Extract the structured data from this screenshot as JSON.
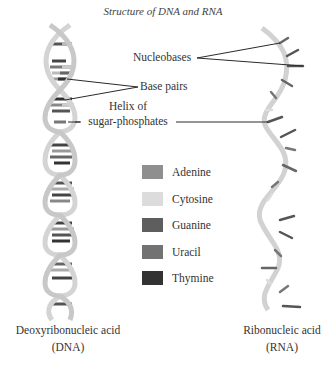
{
  "title": "Structure of DNA and RNA",
  "labels": {
    "nucleobases": "Nucleobases",
    "base_pairs": "Base pairs",
    "helix_line1": "Helix of",
    "helix_line2": "sugar-phosphates"
  },
  "legend": [
    {
      "label": "Adenine",
      "color": "#8f8f8f"
    },
    {
      "label": "Cytosine",
      "color": "#dcdcdc"
    },
    {
      "label": "Guanine",
      "color": "#5e5e5e"
    },
    {
      "label": "Uracil",
      "color": "#727272"
    },
    {
      "label": "Thymine",
      "color": "#333333"
    }
  ],
  "molecules": {
    "dna": {
      "name_line1": "Deoxyribonucleic acid",
      "name_line2": "(DNA)"
    },
    "rna": {
      "name_line1": "Ribonucleic acid",
      "name_line2": "(RNA)"
    }
  },
  "colors": {
    "backbone": "#d6d6d6",
    "backbone_edge": "#bdbdbd",
    "pointer_line": "#2a2a2a"
  }
}
